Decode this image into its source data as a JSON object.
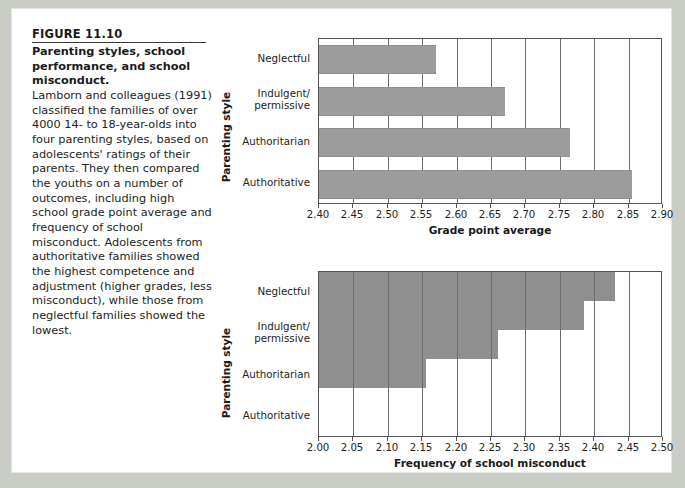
{
  "figure": {
    "number": "FIGURE 11.10",
    "title": "Parenting styles, school performance, and school misconduct.",
    "body": "Lamborn and colleagues (1991) classified the families of over 4000 14- to 18-year-olds into four parenting styles, based on adolescents' ratings of their parents. They then compared the youths on a number of outcomes, including high school grade point average and frequency of school misconduct. Adolescents from authoritative families showed the highest competence and adjustment (higher grades, less misconduct), while those from neglectful families showed the lowest."
  },
  "colors": {
    "bar_top": "#9c9c9c",
    "bar_bottom": "#8f8f8f",
    "axis": "#555555",
    "gridline": "#6d6d6d",
    "page_background": "#c9cdc6",
    "card_background": "#ffffff"
  },
  "chart_data": [
    {
      "type": "bar",
      "orientation": "horizontal",
      "title": "",
      "xlabel": "Grade point average",
      "ylabel": "Parenting style",
      "categories": [
        "Neglectful",
        "Indulgent/\npermissive",
        "Authoritarian",
        "Authoritative"
      ],
      "values": [
        2.57,
        2.67,
        2.765,
        2.855
      ],
      "xlim": [
        2.4,
        2.9
      ],
      "xticks": [
        2.4,
        2.45,
        2.5,
        2.55,
        2.6,
        2.65,
        2.7,
        2.75,
        2.8,
        2.85,
        2.9
      ],
      "xticklabels": [
        "2.40",
        "2.45",
        "2.50",
        "2.55",
        "2.60",
        "2.65",
        "2.70",
        "2.75",
        "2.80",
        "2.85",
        "2.90"
      ],
      "grid": true,
      "legend": null
    },
    {
      "type": "bar",
      "orientation": "horizontal",
      "title": "",
      "xlabel": "Frequency of school misconduct",
      "ylabel": "Parenting style",
      "categories": [
        "Neglectful",
        "Indulgent/\npermissive",
        "Authoritarian",
        "Authoritative"
      ],
      "values": [
        2.43,
        2.385,
        2.26,
        2.155
      ],
      "xlim": [
        2.0,
        2.5
      ],
      "xticks": [
        2.0,
        2.05,
        2.1,
        2.15,
        2.2,
        2.25,
        2.3,
        2.35,
        2.4,
        2.45,
        2.5
      ],
      "xticklabels": [
        "2.00",
        "2.05",
        "2.10",
        "2.15",
        "2.20",
        "2.25",
        "2.30",
        "2.35",
        "2.40",
        "2.45",
        "2.50"
      ],
      "grid": true,
      "legend": null
    }
  ]
}
